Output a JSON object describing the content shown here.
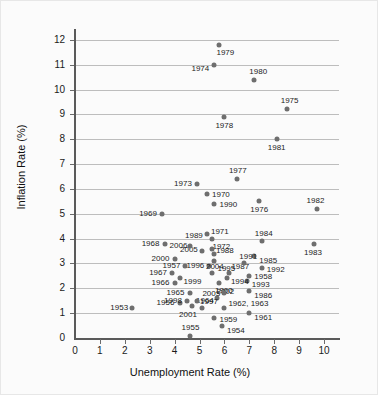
{
  "chart_data": {
    "type": "scatter",
    "title": "",
    "xlabel": "Unemployment Rate (%)",
    "ylabel": "Inflation Rate (%)",
    "xlim": [
      0,
      10.6
    ],
    "ylim": [
      0,
      12.4
    ],
    "xticks": [
      0,
      1,
      2,
      3,
      4,
      5,
      6,
      7,
      8,
      9,
      10
    ],
    "yticks": [
      0,
      1,
      2,
      3,
      4,
      5,
      6,
      7,
      8,
      9,
      10,
      11,
      12
    ],
    "grid": "horizontal",
    "legend": "none",
    "point_color": "#6e6e6e",
    "points": [
      {
        "label": "1953",
        "x": 2.3,
        "y": 1.2,
        "lx": -22,
        "ly": -4
      },
      {
        "label": "1954",
        "x": 5.9,
        "y": 0.5,
        "lx": 5,
        "ly": 1
      },
      {
        "label": "1955",
        "x": 4.6,
        "y": 0.1,
        "lx": -8,
        "ly": -12
      },
      {
        "label": "1956",
        "x": 4.2,
        "y": 1.4,
        "lx": -23,
        "ly": -4
      },
      {
        "label": "1957",
        "x": 4.4,
        "y": 2.9,
        "lx": -22,
        "ly": -4
      },
      {
        "label": "1958",
        "x": 7.0,
        "y": 2.5,
        "lx": 5,
        "ly": -3
      },
      {
        "label": "1959",
        "x": 5.6,
        "y": 0.8,
        "lx": 5,
        "ly": -2
      },
      {
        "label": "1960",
        "x": 5.7,
        "y": 1.6,
        "lx": -2,
        "ly": -11
      },
      {
        "label": "1961",
        "x": 7.0,
        "y": 1.0,
        "lx": 5,
        "ly": 1
      },
      {
        "label": "1962, 1963",
        "x": 6.0,
        "y": 1.2,
        "lx": 4,
        "ly": -8
      },
      {
        "label": "1964",
        "x": 5.1,
        "y": 1.2,
        "lx": -6,
        "ly": -11
      },
      {
        "label": "1965",
        "x": 4.6,
        "y": 1.8,
        "lx": -23,
        "ly": -4
      },
      {
        "label": "1966",
        "x": 4.0,
        "y": 2.2,
        "lx": -23,
        "ly": -4
      },
      {
        "label": "1967",
        "x": 3.9,
        "y": 2.6,
        "lx": -23,
        "ly": -4
      },
      {
        "label": "1968",
        "x": 3.6,
        "y": 3.8,
        "lx": -23,
        "ly": -4
      },
      {
        "label": "1969",
        "x": 3.5,
        "y": 5.0,
        "lx": -23,
        "ly": -4
      },
      {
        "label": "1970",
        "x": 5.3,
        "y": 5.8,
        "lx": 5,
        "ly": -3
      },
      {
        "label": "1971",
        "x": 5.5,
        "y": 4.0,
        "lx": -1,
        "ly": -11
      },
      {
        "label": "1972",
        "x": 5.6,
        "y": 3.4,
        "lx": -2,
        "ly": -11
      },
      {
        "label": "1973",
        "x": 4.9,
        "y": 6.2,
        "lx": -23,
        "ly": -4
      },
      {
        "label": "1974",
        "x": 5.6,
        "y": 11.0,
        "lx": -23,
        "ly": 0
      },
      {
        "label": "1975",
        "x": 8.5,
        "y": 9.2,
        "lx": -6,
        "ly": -12
      },
      {
        "label": "1976",
        "x": 7.4,
        "y": 5.5,
        "lx": -9,
        "ly": 5
      },
      {
        "label": "1977",
        "x": 6.5,
        "y": 6.4,
        "lx": -8,
        "ly": -12
      },
      {
        "label": "1978",
        "x": 6.0,
        "y": 8.9,
        "lx": -9,
        "ly": 5
      },
      {
        "label": "1979",
        "x": 5.8,
        "y": 11.8,
        "lx": -3,
        "ly": 4
      },
      {
        "label": "1980",
        "x": 7.2,
        "y": 10.4,
        "lx": -5,
        "ly": -12
      },
      {
        "label": "1981",
        "x": 8.1,
        "y": 8.0,
        "lx": -9,
        "ly": 5
      },
      {
        "label": "1982",
        "x": 9.7,
        "y": 5.2,
        "lx": -10,
        "ly": -12
      },
      {
        "label": "1983",
        "x": 9.6,
        "y": 3.8,
        "lx": -10,
        "ly": 5
      },
      {
        "label": "1984",
        "x": 7.5,
        "y": 3.9,
        "lx": -7,
        "ly": -11
      },
      {
        "label": "1985",
        "x": 7.2,
        "y": 3.3,
        "lx": 5,
        "ly": 1
      },
      {
        "label": "1986",
        "x": 7.0,
        "y": 1.9,
        "lx": 5,
        "ly": 1
      },
      {
        "label": "1987",
        "x": 6.2,
        "y": 2.6,
        "lx": 2,
        "ly": -10
      },
      {
        "label": "1988",
        "x": 5.5,
        "y": 3.6,
        "lx": 4,
        "ly": -2
      },
      {
        "label": "1989",
        "x": 5.3,
        "y": 4.2,
        "lx": -22,
        "ly": -2
      },
      {
        "label": "1990",
        "x": 5.6,
        "y": 5.4,
        "lx": 5,
        "ly": -3
      },
      {
        "label": "1991",
        "x": 6.8,
        "y": 3.0,
        "lx": -5,
        "ly": -10
      },
      {
        "label": "1992",
        "x": 7.5,
        "y": 2.8,
        "lx": 5,
        "ly": -2
      },
      {
        "label": "1993",
        "x": 6.9,
        "y": 2.3,
        "lx": 5,
        "ly": 0
      },
      {
        "label": "1994",
        "x": 6.1,
        "y": 2.4,
        "lx": 4,
        "ly": 0
      },
      {
        "label": "1995",
        "x": 5.6,
        "y": 3.1,
        "lx": 3,
        "ly": 4
      },
      {
        "label": "1996",
        "x": 5.4,
        "y": 2.9,
        "lx": -23,
        "ly": -4
      },
      {
        "label": "1997",
        "x": 4.9,
        "y": 1.5,
        "lx": 3,
        "ly": -3
      },
      {
        "label": "1998",
        "x": 4.5,
        "y": 1.5,
        "lx": -23,
        "ly": -4
      },
      {
        "label": "1999",
        "x": 4.2,
        "y": 2.4,
        "lx": 4,
        "ly": 0
      },
      {
        "label": "2000",
        "x": 4.0,
        "y": 3.2,
        "lx": -23,
        "ly": -4
      },
      {
        "label": "2001",
        "x": 4.7,
        "y": 1.3,
        "lx": -13,
        "ly": 5
      },
      {
        "label": "2002",
        "x": 5.8,
        "y": 2.2,
        "lx": -3,
        "ly": 5
      },
      {
        "label": "2003",
        "x": 6.0,
        "y": 1.8,
        "lx": -22,
        "ly": -3
      },
      {
        "label": "2004",
        "x": 5.5,
        "y": 2.6,
        "lx": -6,
        "ly": -10
      },
      {
        "label": "2005",
        "x": 5.1,
        "y": 3.5,
        "lx": -22,
        "ly": -5
      },
      {
        "label": "2006",
        "x": 4.6,
        "y": 3.7,
        "lx": -20,
        "ly": -4
      }
    ]
  }
}
